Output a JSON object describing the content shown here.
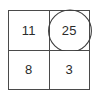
{
  "figure": {
    "type": "number-grid",
    "rows": 2,
    "columns": 2,
    "border_color": "#4a4a4a",
    "text_color": "#2b2b2b",
    "background_color": "#ffffff",
    "circle_color": "#3d3d3d"
  },
  "cells": [
    {
      "id": "cell-top-left",
      "value": "11",
      "circled": false
    },
    {
      "id": "cell-top-right",
      "value": "25",
      "circled": true
    },
    {
      "id": "cell-bottom-left",
      "value": "8",
      "circled": false
    },
    {
      "id": "cell-bottom-right",
      "value": "3",
      "circled": false
    }
  ],
  "annotation": {
    "circle_icon_name": "circle-highlight-icon",
    "circled_value": "25"
  }
}
